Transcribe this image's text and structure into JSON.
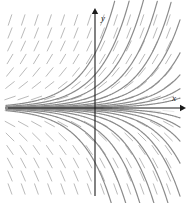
{
  "figure": {
    "kind": "slope-field-with-solution-curves",
    "background_color": "#ffffff",
    "width": 190,
    "height": 203
  },
  "axes": {
    "x_label": "x",
    "y_label": "y",
    "axis_color": "#1a1a1a",
    "origin_px": {
      "x": 95,
      "y": 108
    },
    "x_axis_y_px": 108,
    "y_axis_x_px": 95,
    "x_axis_start_px": 8,
    "x_axis_end_px": 180,
    "y_axis_top_px": 14,
    "y_axis_bottom_px": 196,
    "x_label_px": {
      "x": 172,
      "y": 101
    },
    "y_label_px": {
      "x": 101,
      "y": 21
    }
  },
  "chart_data": {
    "type": "line",
    "title": "",
    "xlabel": "x",
    "ylabel": "y",
    "grid": false,
    "legend": null,
    "xlim": [
      -3.2,
      2.9
    ],
    "ylim": [
      -3.1,
      3.1
    ],
    "curve_color": "#8c8c8c",
    "curve_width": 1.2,
    "dash_color": "#9a9a9a",
    "dash_width": 0.9,
    "growth_rate_k": 1.0,
    "curve_constants": [
      0.018,
      0.035,
      0.06,
      0.1,
      0.16,
      0.26,
      0.42,
      0.68,
      1.1,
      1.8,
      -0.018,
      -0.035,
      -0.06,
      -0.1,
      -0.16,
      -0.26,
      -0.42,
      -0.68,
      -1.1,
      -1.8
    ],
    "series": [
      {
        "name": "y = 1.8e^x",
        "C": 1.8
      },
      {
        "name": "y = 1.1e^x",
        "C": 1.1
      },
      {
        "name": "y = 0.68e^x",
        "C": 0.68
      },
      {
        "name": "y = 0.42e^x",
        "C": 0.42
      },
      {
        "name": "y = 0.26e^x",
        "C": 0.26
      },
      {
        "name": "y = 0.16e^x",
        "C": 0.16
      },
      {
        "name": "y = 0.1e^x",
        "C": 0.1
      },
      {
        "name": "y = 0.06e^x",
        "C": 0.06
      },
      {
        "name": "y = 0.035e^x",
        "C": 0.035
      },
      {
        "name": "y = 0.018e^x",
        "C": 0.018
      },
      {
        "name": "y = -0.018e^x",
        "C": -0.018
      },
      {
        "name": "y = -0.035e^x",
        "C": -0.035
      },
      {
        "name": "y = -0.06e^x",
        "C": -0.06
      },
      {
        "name": "y = -0.1e^x",
        "C": -0.1
      },
      {
        "name": "y = -0.16e^x",
        "C": -0.16
      },
      {
        "name": "y = -0.26e^x",
        "C": -0.26
      },
      {
        "name": "y = -0.42e^x",
        "C": -0.42
      },
      {
        "name": "y = -0.68e^x",
        "C": -0.68
      },
      {
        "name": "y = -1.1e^x",
        "C": -1.1
      },
      {
        "name": "y = -1.8e^x",
        "C": -1.8
      }
    ],
    "slope_field": {
      "x_start_px": 10,
      "x_step_px": 13.2,
      "x_count": 13,
      "y_start_px": 20,
      "y_step_px": 13.0,
      "y_count": 14,
      "dash_length_px": 11
    }
  }
}
